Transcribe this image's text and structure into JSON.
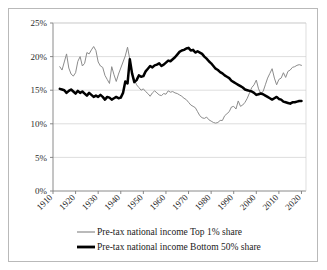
{
  "chart_data": {
    "type": "line",
    "title": "",
    "subtitle": "",
    "xlabel": "",
    "ylabel": "",
    "xlim": [
      1910,
      2022
    ],
    "ylim": [
      0,
      25
    ],
    "grid": true,
    "legend_position": "bottom",
    "y_ticks": [
      "0%",
      "5%",
      "10%",
      "15%",
      "20%",
      "25%"
    ],
    "y_tick_values": [
      0,
      5,
      10,
      15,
      20,
      25
    ],
    "x_ticks": [
      "1910",
      "1920",
      "1930",
      "1940",
      "1950",
      "1960",
      "1970",
      "1980",
      "1990",
      "2000",
      "2010",
      "2020"
    ],
    "x_tick_values": [
      1910,
      1920,
      1930,
      1940,
      1950,
      1960,
      1970,
      1980,
      1990,
      2000,
      2010,
      2020
    ],
    "series": [
      {
        "name": "Pre-tax national income Top 1%  share",
        "color": "#8c8c8c",
        "line_width": 1.0,
        "x": [
          1913,
          1914,
          1915,
          1916,
          1917,
          1918,
          1919,
          1920,
          1921,
          1922,
          1923,
          1924,
          1925,
          1926,
          1927,
          1928,
          1929,
          1930,
          1931,
          1932,
          1933,
          1934,
          1935,
          1936,
          1937,
          1938,
          1939,
          1940,
          1941,
          1942,
          1943,
          1944,
          1945,
          1946,
          1947,
          1948,
          1949,
          1950,
          1951,
          1952,
          1953,
          1954,
          1955,
          1956,
          1957,
          1958,
          1959,
          1960,
          1961,
          1962,
          1963,
          1964,
          1965,
          1966,
          1967,
          1968,
          1969,
          1970,
          1971,
          1972,
          1973,
          1974,
          1975,
          1976,
          1977,
          1978,
          1979,
          1980,
          1981,
          1982,
          1983,
          1984,
          1985,
          1986,
          1987,
          1988,
          1989,
          1990,
          1991,
          1992,
          1993,
          1994,
          1995,
          1996,
          1997,
          1998,
          1999,
          2000,
          2001,
          2002,
          2003,
          2004,
          2005,
          2006,
          2007,
          2008,
          2009,
          2010,
          2011,
          2012,
          2013,
          2014,
          2015,
          2016,
          2017,
          2018,
          2019,
          2020
        ],
        "y": [
          18.5,
          18.0,
          19.2,
          20.4,
          18.3,
          17.4,
          17.1,
          17.6,
          19.3,
          20.0,
          18.6,
          19.0,
          20.6,
          20.4,
          21.0,
          21.5,
          20.9,
          19.2,
          18.6,
          18.4,
          17.2,
          16.6,
          16.0,
          18.5,
          17.3,
          16.3,
          17.4,
          18.3,
          19.2,
          20.1,
          21.4,
          19.6,
          17.4,
          16.6,
          15.8,
          15.4,
          15.0,
          15.2,
          14.8,
          14.5,
          14.1,
          14.6,
          14.9,
          14.6,
          14.3,
          14.2,
          14.5,
          14.4,
          14.9,
          14.7,
          14.8,
          14.6,
          14.5,
          14.3,
          14.1,
          13.8,
          13.6,
          13.2,
          12.8,
          12.6,
          12.4,
          11.8,
          11.2,
          10.9,
          10.8,
          11.0,
          10.6,
          10.4,
          10.2,
          10.1,
          10.2,
          10.5,
          10.5,
          11.2,
          11.5,
          11.8,
          12.5,
          12.6,
          12.2,
          13.4,
          12.6,
          12.8,
          13.2,
          13.8,
          14.6,
          15.4,
          15.8,
          16.5,
          15.2,
          14.5,
          14.8,
          15.8,
          16.8,
          17.5,
          18.2,
          16.8,
          15.8,
          16.6,
          16.8,
          17.6,
          16.9,
          17.8,
          18.0,
          18.4,
          18.5,
          18.7,
          18.8,
          18.7
        ],
        "start_value": 18.5,
        "end_value": 18.7,
        "peak_value": 21.5,
        "peak_year": 1928,
        "trough_value": 10.1,
        "trough_year": 1982
      },
      {
        "name": "Pre-tax national income Bottom 50% share",
        "color": "#000000",
        "line_width": 2.5,
        "x": [
          1913,
          1914,
          1915,
          1916,
          1917,
          1918,
          1919,
          1920,
          1921,
          1922,
          1923,
          1924,
          1925,
          1926,
          1927,
          1928,
          1929,
          1930,
          1931,
          1932,
          1933,
          1934,
          1935,
          1936,
          1937,
          1938,
          1939,
          1940,
          1941,
          1942,
          1943,
          1944,
          1945,
          1946,
          1947,
          1948,
          1949,
          1950,
          1951,
          1952,
          1953,
          1954,
          1955,
          1956,
          1957,
          1958,
          1959,
          1960,
          1961,
          1962,
          1963,
          1964,
          1965,
          1966,
          1967,
          1968,
          1969,
          1970,
          1971,
          1972,
          1973,
          1974,
          1975,
          1976,
          1977,
          1978,
          1979,
          1980,
          1981,
          1982,
          1983,
          1984,
          1985,
          1986,
          1987,
          1988,
          1989,
          1990,
          1991,
          1992,
          1993,
          1994,
          1995,
          1996,
          1997,
          1998,
          1999,
          2000,
          2001,
          2002,
          2003,
          2004,
          2005,
          2006,
          2007,
          2008,
          2009,
          2010,
          2011,
          2012,
          2013,
          2014,
          2015,
          2016,
          2017,
          2018,
          2019,
          2020
        ],
        "y": [
          15.2,
          15.1,
          15.0,
          14.6,
          14.9,
          15.1,
          14.8,
          14.5,
          14.9,
          14.6,
          14.8,
          14.5,
          14.2,
          14.6,
          14.3,
          14.0,
          14.2,
          14.0,
          14.3,
          14.0,
          13.6,
          14.0,
          13.9,
          13.6,
          13.8,
          14.0,
          13.8,
          13.9,
          14.6,
          16.3,
          16.0,
          19.6,
          17.5,
          16.2,
          16.5,
          17.2,
          17.0,
          17.1,
          17.8,
          18.2,
          18.6,
          18.4,
          18.7,
          18.8,
          19.0,
          18.6,
          18.8,
          19.1,
          19.4,
          19.3,
          19.6,
          19.9,
          20.3,
          20.7,
          20.9,
          21.0,
          21.2,
          21.3,
          20.9,
          21.0,
          20.6,
          20.8,
          20.6,
          20.4,
          20.0,
          19.7,
          19.3,
          19.0,
          18.6,
          18.2,
          18.0,
          17.7,
          17.5,
          17.2,
          17.0,
          16.8,
          16.4,
          16.2,
          16.0,
          15.8,
          15.6,
          15.4,
          15.1,
          15.0,
          14.9,
          14.8,
          14.6,
          14.3,
          14.4,
          14.5,
          14.4,
          14.2,
          14.0,
          13.8,
          13.6,
          13.8,
          14.0,
          13.7,
          13.6,
          13.3,
          13.2,
          13.1,
          13.0,
          13.2,
          13.2,
          13.3,
          13.4,
          13.4
        ],
        "start_value": 15.2,
        "end_value": 13.4,
        "peak_value": 21.3,
        "peak_year": 1970,
        "trough_value": 13.0,
        "trough_year": 2015
      }
    ]
  },
  "legend": {
    "items": [
      {
        "label": "Pre-tax national income Top 1%  share",
        "style": "thin-gray-line"
      },
      {
        "label": "Pre-tax national income Bottom 50% share",
        "style": "thick-black-line"
      }
    ]
  },
  "colors": {
    "top1_line": "#8c8c8c",
    "bottom50_line": "#000000",
    "gridline": "#d0d0d0",
    "axis": "#7d7d7d",
    "frame_border": "#b9b9b9",
    "background": "#ffffff",
    "text": "#1a1a1a"
  }
}
